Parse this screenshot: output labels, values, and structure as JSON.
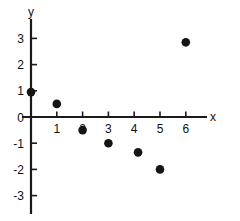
{
  "chart_data": {
    "type": "scatter",
    "title": "",
    "xlabel": "x",
    "ylabel": "y",
    "grid": false,
    "legend": "none",
    "xlim": [
      -0.35,
      6.9
    ],
    "ylim": [
      -3.3,
      3.5
    ],
    "xticks": [
      1,
      2,
      3,
      4,
      5,
      6
    ],
    "yticks": [
      3,
      2,
      1,
      0,
      -1,
      -2,
      -3
    ],
    "xtick_labels": [
      "1",
      "2",
      "3",
      "4",
      "5",
      "6"
    ],
    "ytick_labels": [
      "3",
      "2",
      "1",
      "0",
      "-1",
      "-2",
      "-3"
    ],
    "marker": "filled-circle",
    "marker_color": "#151515",
    "points": [
      {
        "x": 0,
        "y": 0.95
      },
      {
        "x": 1,
        "y": 0.5
      },
      {
        "x": 2,
        "y": -0.5
      },
      {
        "x": 3,
        "y": -1.0
      },
      {
        "x": 4.15,
        "y": -1.35
      },
      {
        "x": 5,
        "y": -2.0
      },
      {
        "x": 6,
        "y": 2.85
      }
    ]
  },
  "axes": {
    "x_label": "x",
    "y_label": "y",
    "axis_color": "#1a1a1a"
  }
}
